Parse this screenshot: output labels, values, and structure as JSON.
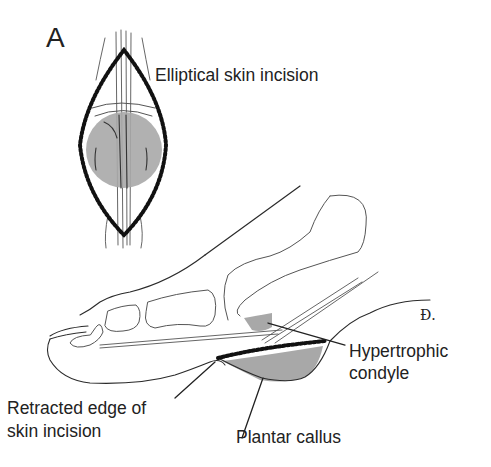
{
  "figure": {
    "panel_label": "A",
    "labels": {
      "elliptical": "Elliptical skin incision",
      "hypertrophic_line1": "Hypertrophic",
      "hypertrophic_line2": "condyle",
      "retracted_line1": "Retracted edge of",
      "retracted_line2": "skin incision",
      "plantar": "Plantar callus"
    },
    "signature": "Ɖ."
  },
  "colors": {
    "line": "#2a2a2a",
    "shading": "#a8a8a8",
    "background": "#ffffff"
  }
}
